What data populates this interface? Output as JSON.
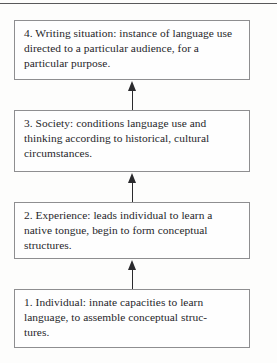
{
  "diagram": {
    "type": "upward-flowchart",
    "orientation": "bottom-to-top",
    "divider": "top-horizontal-rule",
    "arrow_direction": "up",
    "colors": {
      "background": "#fdfdfc",
      "box_fill": "#fefefe",
      "box_border": "#8e8e90",
      "text": "#26262a",
      "arrow": "#2a2a2d",
      "rule": "#58585a"
    },
    "nodes": [
      {
        "id": "node-4",
        "number": "4",
        "term": "Writing situation",
        "text": "4. Writing situation: instance of language use directed to a particular audience, for a particular purpose."
      },
      {
        "id": "node-3",
        "number": "3",
        "term": "Society",
        "text": "3. Society: conditions language use and thinking according to historical, cultural circumstances."
      },
      {
        "id": "node-2",
        "number": "2",
        "term": "Experience",
        "text": "2. Experience: leads individual to learn a native tongue, begin to form conceptual structures."
      },
      {
        "id": "node-1",
        "number": "1",
        "term": "Individual",
        "text": "1. Individual: innate capacities to learn language, to assemble conceptual struc-\ntures."
      }
    ],
    "arrows": [
      {
        "id": "arrow-1-to-2",
        "from": "node-1",
        "to": "node-2",
        "glyph": "up-arrow"
      },
      {
        "id": "arrow-2-to-3",
        "from": "node-2",
        "to": "node-3",
        "glyph": "up-arrow"
      },
      {
        "id": "arrow-3-to-4",
        "from": "node-3",
        "to": "node-4",
        "glyph": "up-arrow"
      }
    ]
  }
}
